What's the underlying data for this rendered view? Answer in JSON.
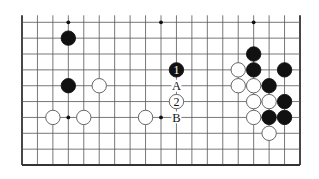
{
  "diagram": {
    "type": "go-board-fragment",
    "board_size": 19,
    "visible_rows": 10,
    "edges": [
      "left",
      "right",
      "bottom"
    ],
    "colors": {
      "background": "#ffffff",
      "grid": "#555555",
      "edge": "#333333",
      "black_stone": "#111111",
      "white_stone": "#ffffff",
      "white_stone_outline": "#555555"
    },
    "star_points": [
      {
        "col": 3,
        "row": 0
      },
      {
        "col": 9,
        "row": 0
      },
      {
        "col": 15,
        "row": 0
      },
      {
        "col": 3,
        "row": 6
      },
      {
        "col": 9,
        "row": 6
      },
      {
        "col": 15,
        "row": 6
      }
    ],
    "stones": [
      {
        "color": "black",
        "col": 3,
        "row": 1,
        "label": ""
      },
      {
        "color": "black",
        "col": 3,
        "row": 4,
        "label": ""
      },
      {
        "color": "white",
        "col": 5,
        "row": 4,
        "label": ""
      },
      {
        "color": "white",
        "col": 2,
        "row": 6,
        "label": ""
      },
      {
        "color": "white",
        "col": 4,
        "row": 6,
        "label": ""
      },
      {
        "color": "white",
        "col": 8,
        "row": 6,
        "label": ""
      },
      {
        "color": "black",
        "col": 10,
        "row": 3,
        "label": "1"
      },
      {
        "color": "white",
        "col": 10,
        "row": 5,
        "label": "2"
      },
      {
        "color": "black",
        "col": 15,
        "row": 2,
        "label": ""
      },
      {
        "color": "white",
        "col": 14,
        "row": 3,
        "label": ""
      },
      {
        "color": "black",
        "col": 15,
        "row": 3,
        "label": ""
      },
      {
        "color": "black",
        "col": 17,
        "row": 3,
        "label": ""
      },
      {
        "color": "white",
        "col": 14,
        "row": 4,
        "label": ""
      },
      {
        "color": "white",
        "col": 15,
        "row": 4,
        "label": ""
      },
      {
        "color": "black",
        "col": 16,
        "row": 4,
        "label": ""
      },
      {
        "color": "white",
        "col": 15,
        "row": 5,
        "label": ""
      },
      {
        "color": "white",
        "col": 16,
        "row": 5,
        "label": ""
      },
      {
        "color": "black",
        "col": 17,
        "row": 5,
        "label": ""
      },
      {
        "color": "white",
        "col": 15,
        "row": 6,
        "label": ""
      },
      {
        "color": "black",
        "col": 16,
        "row": 6,
        "label": ""
      },
      {
        "color": "black",
        "col": 17,
        "row": 6,
        "label": ""
      },
      {
        "color": "white",
        "col": 16,
        "row": 7,
        "label": ""
      }
    ],
    "point_labels": [
      {
        "text": "A",
        "col": 10,
        "row": 4
      },
      {
        "text": "B",
        "col": 10,
        "row": 6
      }
    ]
  }
}
